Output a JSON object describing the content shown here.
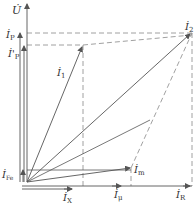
{
  "diagram": {
    "type": "phasor-diagram",
    "colors": {
      "line": "#555555",
      "dashed": "#888888",
      "text": "#333333",
      "background": "#ffffff"
    },
    "labels": {
      "U": {
        "base": "U̇",
        "sub": ""
      },
      "I2": {
        "base": "İ",
        "sub": "2"
      },
      "I1": {
        "base": "İ",
        "sub": "1"
      },
      "IP": {
        "base": "İ",
        "sub": "P"
      },
      "IP_prime": {
        "base": "İ'",
        "sub": "P"
      },
      "Im": {
        "base": "İ",
        "sub": "m"
      },
      "IFe": {
        "base": "İ",
        "sub": "Fe"
      },
      "IX": {
        "base": "İ",
        "sub": "X"
      },
      "Imu": {
        "base": "İ",
        "sub": "μ"
      },
      "IR": {
        "base": "İ",
        "sub": "R"
      }
    }
  }
}
